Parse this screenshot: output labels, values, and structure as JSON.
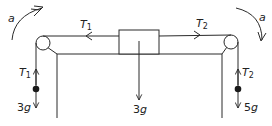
{
  "diagram": {
    "type": "pulley-system",
    "colors": {
      "line": "#2a2a2a",
      "background": "#ffffff"
    },
    "labels": {
      "accel_left": "a",
      "accel_right": "a",
      "tension_top_left": {
        "main": "T",
        "sub": "1"
      },
      "tension_top_right": {
        "main": "T",
        "sub": "2"
      },
      "tension_hang_left": {
        "main": "T",
        "sub": "1"
      },
      "tension_hang_right": {
        "main": "T",
        "sub": "2"
      },
      "weight_left": {
        "num": "3",
        "var": "g"
      },
      "weight_center": {
        "num": "3",
        "var": "g"
      },
      "weight_right": {
        "num": "5",
        "var": "g"
      }
    }
  }
}
